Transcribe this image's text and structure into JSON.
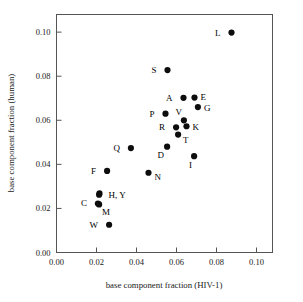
{
  "chart_data": {
    "type": "scatter",
    "title": "",
    "xlabel": "base component fraction (HIV-1)",
    "ylabel": "base component fraction (human)",
    "xlim": [
      0.0,
      0.108
    ],
    "ylim": [
      0.0,
      0.108
    ],
    "xticks": [
      "0.00",
      "0.02",
      "0.04",
      "0.06",
      "0.08",
      "0.10"
    ],
    "xtick_values": [
      0.0,
      0.02,
      0.04,
      0.06,
      0.08,
      0.1
    ],
    "yticks": [
      "0.00",
      "0.02",
      "0.04",
      "0.06",
      "0.08",
      "0.10"
    ],
    "ytick_values": [
      0.0,
      0.02,
      0.04,
      0.06,
      0.08,
      0.1
    ],
    "grid": false,
    "legend": "none",
    "marker": "filled-circle",
    "marker_color": "#0d0d0d",
    "points": [
      {
        "label": "L",
        "x": 0.0875,
        "y": 0.0998,
        "label_dx": -11,
        "label_dy": 3
      },
      {
        "label": "S",
        "x": 0.0555,
        "y": 0.0828,
        "label_dx": -11,
        "label_dy": 3
      },
      {
        "label": "A",
        "x": 0.0635,
        "y": 0.0702,
        "label_dx": -11,
        "label_dy": 3
      },
      {
        "label": "E",
        "x": 0.069,
        "y": 0.0703,
        "label_dx": 6,
        "label_dy": 2
      },
      {
        "label": "G",
        "x": 0.0707,
        "y": 0.066,
        "label_dx": 6,
        "label_dy": 4
      },
      {
        "label": "P",
        "x": 0.0545,
        "y": 0.063,
        "label_dx": -11,
        "label_dy": 3
      },
      {
        "label": "V",
        "x": 0.0637,
        "y": 0.06,
        "label_dx": -2,
        "label_dy": -5
      },
      {
        "label": "R",
        "x": 0.0598,
        "y": 0.0568,
        "label_dx": -11,
        "label_dy": 3
      },
      {
        "label": "K",
        "x": 0.065,
        "y": 0.0573,
        "label_dx": 6,
        "label_dy": 4
      },
      {
        "label": "T",
        "x": 0.0608,
        "y": 0.0535,
        "label_dx": 5,
        "label_dy": 8
      },
      {
        "label": "D",
        "x": 0.0553,
        "y": 0.048,
        "label_dx": -3,
        "label_dy": 11
      },
      {
        "label": "I",
        "x": 0.0688,
        "y": 0.0437,
        "label_dx": -2,
        "label_dy": 12
      },
      {
        "label": "Q",
        "x": 0.0372,
        "y": 0.0474,
        "label_dx": -11,
        "label_dy": 3
      },
      {
        "label": "F",
        "x": 0.0253,
        "y": 0.037,
        "label_dx": -11,
        "label_dy": 3
      },
      {
        "label": "N",
        "x": 0.046,
        "y": 0.0362,
        "label_dx": 6,
        "label_dy": 7
      },
      {
        "label": "H, Y",
        "x": 0.0215,
        "y": 0.0268,
        "label_dx": 9,
        "label_dy": 5
      },
      {
        "label": "",
        "x": 0.0213,
        "y": 0.0262,
        "label_dx": 0,
        "label_dy": 0
      },
      {
        "label": "C",
        "x": 0.0207,
        "y": 0.0222,
        "label_dx": -11,
        "label_dy": 2
      },
      {
        "label": "M",
        "x": 0.0213,
        "y": 0.0218,
        "label_dx": 3,
        "label_dy": 11
      },
      {
        "label": "W",
        "x": 0.0263,
        "y": 0.0126,
        "label_dx": -11,
        "label_dy": 3
      }
    ]
  },
  "axes": {
    "x_title": "base component fraction (HIV-1)",
    "y_title": "base component fraction (human)"
  }
}
